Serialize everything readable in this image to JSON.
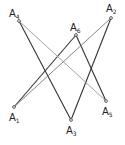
{
  "diagram": {
    "type": "point-line-configuration",
    "points": [
      {
        "id": "A1",
        "label": "A",
        "sub": "1",
        "x": 14,
        "y": 107,
        "lx": 9,
        "ly": 121
      },
      {
        "id": "A2",
        "label": "A",
        "sub": "2",
        "x": 111,
        "y": 18,
        "lx": 106,
        "ly": 12
      },
      {
        "id": "A3",
        "label": "A",
        "sub": "3",
        "x": 71,
        "y": 120,
        "lx": 66,
        "ly": 134
      },
      {
        "id": "A4",
        "label": "A",
        "sub": "4",
        "x": 19,
        "y": 21,
        "lx": 9,
        "ly": 17
      },
      {
        "id": "A5",
        "label": "A",
        "sub": "5",
        "x": 106,
        "y": 101,
        "lx": 102,
        "ly": 115
      },
      {
        "id": "A6",
        "label": "A",
        "sub": "6",
        "x": 76,
        "y": 35,
        "lx": 70,
        "ly": 31
      }
    ],
    "segments": [
      {
        "from": "A4",
        "to": "A3",
        "color": "#333333",
        "width": 1.1
      },
      {
        "from": "A3",
        "to": "A2",
        "color": "#333333",
        "width": 1.1
      },
      {
        "from": "A6",
        "to": "A5",
        "color": "#333333",
        "width": 1.1
      },
      {
        "from": "A6",
        "to": "A1",
        "color": "#333333",
        "width": 1.1
      },
      {
        "from": "A1",
        "to": "A2",
        "color": "#777777",
        "width": 0.9
      },
      {
        "from": "A4",
        "to": "A5",
        "color": "#999999",
        "width": 0.9
      }
    ],
    "colors": {
      "background": "#ffffff",
      "point_fill": "#ffffff",
      "point_stroke": "#333333"
    }
  }
}
